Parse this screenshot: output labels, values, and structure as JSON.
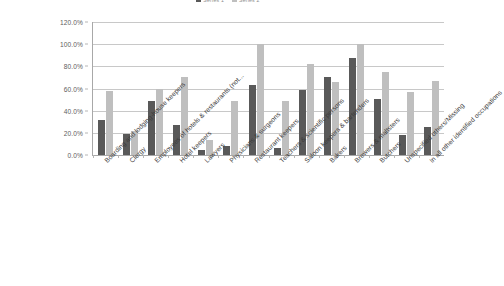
{
  "chart_data": {
    "type": "bar",
    "title": "",
    "xlabel": "",
    "ylabel": "",
    "ylim": [
      0,
      120
    ],
    "ytick_labels": [
      "0.0%",
      "20.0%",
      "40.0%",
      "60.0%",
      "80.0%",
      "100.0%",
      "120.0%"
    ],
    "ytick_values": [
      0,
      20,
      40,
      60,
      80,
      100,
      120
    ],
    "grid": true,
    "legend_position": "top",
    "categories": [
      "Boarding and lodging-house keepers",
      "Clergy",
      "Employees of hotels & restaurants (not...",
      "Hotel keepers",
      "Lawyers",
      "Physicians & surgeons",
      "Restaurant keepers",
      "Teachers & scientific persons",
      "Saloon keepers & bartenders",
      "Bakers",
      "Brewers & maltsters",
      "Butchers",
      "Unspecified others/Missing",
      "In all other identified occupations"
    ],
    "series": [
      {
        "name": "Series 1",
        "color": "#595959",
        "values": [
          32.0,
          19.0,
          49.0,
          27.0,
          4.5,
          8.5,
          63.5,
          6.0,
          58.5,
          70.5,
          87.5,
          50.5,
          18.5,
          25.0
        ]
      },
      {
        "name": "Series 2",
        "color": "#bfbfbf",
        "values": [
          58.0,
          21.5,
          60.0,
          70.5,
          13.5,
          49.0,
          100.0,
          49.0,
          82.5,
          66.0,
          100.0,
          75.0,
          57.0,
          67.0
        ]
      }
    ]
  },
  "footnote": {
    "mark": ""
  }
}
